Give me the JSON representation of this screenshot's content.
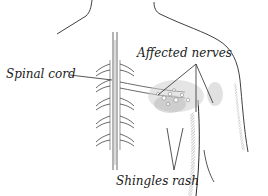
{
  "diagram": {
    "labels": {
      "spinal_cord": "Spinal cord",
      "affected_nerves": "Affected nerves",
      "shingles_rash": "Shingles rash"
    },
    "colors": {
      "line": "#2a2a2a",
      "rash_stipple": "#9a9a9a",
      "background": "#ffffff"
    }
  }
}
